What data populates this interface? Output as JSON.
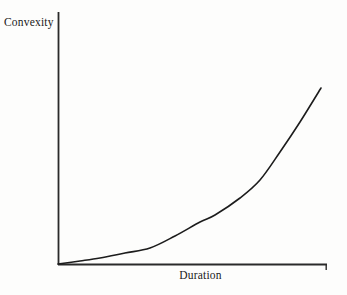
{
  "chart_data": {
    "type": "line",
    "title": "",
    "xlabel": "Duration",
    "ylabel": "Convexity",
    "grid": false,
    "legend": null,
    "annotations": [],
    "axis": {
      "x_range_px": [
        58,
        327
      ],
      "y_range_px": [
        12,
        265
      ],
      "x_ticks": [],
      "y_ticks": [],
      "tick_labels_shown": false,
      "arrowheads": false,
      "end_tick_on_x_axis": true
    },
    "series": [
      {
        "name": "Convexity vs Duration",
        "shape": "convex-increasing",
        "color": "#1c1c1c",
        "line_width_px": 1.6,
        "points_px": [
          [
            58,
            264
          ],
          [
            80,
            261
          ],
          [
            100,
            258
          ],
          [
            125,
            253
          ],
          [
            150,
            248
          ],
          [
            175,
            236
          ],
          [
            200,
            222
          ],
          [
            215,
            215
          ],
          [
            240,
            198
          ],
          [
            260,
            180
          ],
          [
            280,
            152
          ],
          [
            300,
            122
          ],
          [
            321,
            88
          ]
        ],
        "normalized": {
          "x": [
            0.0,
            0.08,
            0.16,
            0.25,
            0.34,
            0.43,
            0.53,
            0.58,
            0.68,
            0.75,
            0.82,
            0.9,
            1.0
          ],
          "y": [
            0.0,
            0.01,
            0.02,
            0.04,
            0.06,
            0.11,
            0.17,
            0.19,
            0.26,
            0.33,
            0.44,
            0.56,
            0.7
          ]
        }
      }
    ]
  },
  "labels": {
    "y_axis": "Convexity",
    "x_axis": "Duration"
  },
  "colors": {
    "background": "#fdfdfc",
    "axis": "#2a2a2a",
    "curve": "#1c1c1c",
    "text": "#1a1a1a"
  }
}
